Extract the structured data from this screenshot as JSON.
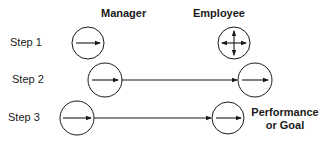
{
  "headers": {
    "manager": "Manager",
    "employee": "Employee"
  },
  "steps": [
    {
      "label": "Step 1",
      "manager_icon": "single-right-arrow-circle",
      "employee_icon": "four-way-arrows-circle",
      "connector": false
    },
    {
      "label": "Step 2",
      "manager_icon": "single-right-arrow-circle",
      "employee_icon": "single-right-arrow-circle",
      "connector": true
    },
    {
      "label": "Step 3",
      "manager_icon": "single-right-arrow-circle",
      "employee_icon": "single-right-arrow-circle",
      "connector": true
    }
  ],
  "goal": {
    "line1": "Performance",
    "line2": "or Goal"
  },
  "colors": {
    "stroke": "#1a1a1a",
    "background": "#ffffff"
  }
}
